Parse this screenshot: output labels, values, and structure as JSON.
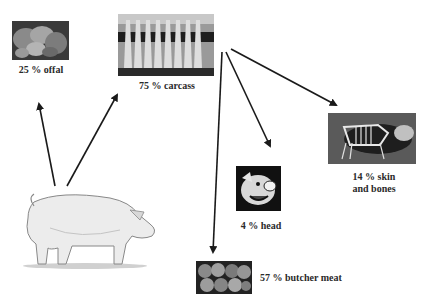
{
  "diagram": {
    "type": "flow",
    "source": {
      "name": "live-pig"
    },
    "nodes": [
      {
        "id": "offal",
        "label": "25 % offal",
        "percent": 25
      },
      {
        "id": "carcass",
        "label": "75 % carcass",
        "percent": 75
      },
      {
        "id": "skin_bones",
        "label_line1": "14 % skin",
        "label_line2": "and bones",
        "percent": 14
      },
      {
        "id": "head",
        "label": "4 % head",
        "percent": 4
      },
      {
        "id": "butcher_meat",
        "label": "57 % butcher meat",
        "percent": 57
      }
    ],
    "edges": [
      {
        "from": "live-pig",
        "to": "offal"
      },
      {
        "from": "live-pig",
        "to": "carcass"
      },
      {
        "from": "carcass",
        "to": "skin_bones"
      },
      {
        "from": "carcass",
        "to": "head"
      },
      {
        "from": "carcass",
        "to": "butcher_meat"
      }
    ],
    "colors": {
      "arrow": "#1a1a1a",
      "label": "#2a2a2a"
    }
  }
}
